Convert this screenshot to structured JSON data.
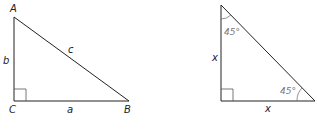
{
  "figures": [
    {
      "name": "general-right-triangle",
      "vertices": {
        "A": "A",
        "B": "B",
        "C": "C"
      },
      "sides": {
        "a": "a",
        "b": "b",
        "c": "c"
      },
      "right_angle_at": "C"
    },
    {
      "name": "isosceles-right-triangle",
      "angles": {
        "top": "45°",
        "bottom_right": "45°"
      },
      "sides": {
        "left": "x",
        "bottom": "x"
      },
      "right_angle_at": "bottom-left"
    }
  ],
  "colors": {
    "line": "#222222",
    "angle_text": "#777777",
    "angle_arc": "#777777"
  }
}
